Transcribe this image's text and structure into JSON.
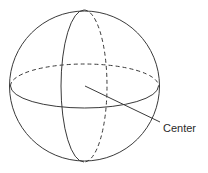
{
  "diagram": {
    "type": "sphere",
    "labels": {
      "center": "Center"
    },
    "colors": {
      "stroke": "#3a3a3a",
      "background": "#ffffff"
    },
    "geometry": {
      "sphere": {
        "cx": 84.5,
        "cy": 86,
        "r": 75
      },
      "equator": {
        "cx": 84.5,
        "cy": 86,
        "rx": 74,
        "ry": 22,
        "back_dashed": true
      },
      "meridian": {
        "cx": 84,
        "cy": 86,
        "rx": 23,
        "ry": 76,
        "back_dashed": true
      },
      "center_line": {
        "x1": 85,
        "y1": 86,
        "x2": 160,
        "y2": 122
      }
    }
  }
}
